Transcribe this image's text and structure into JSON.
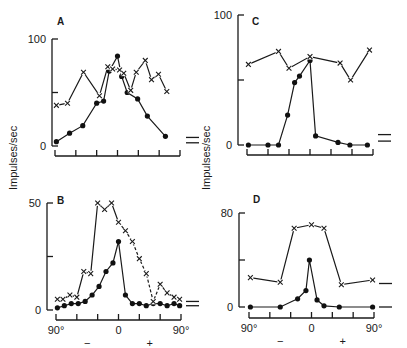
{
  "figure": {
    "ylabel": "Impulses/sec",
    "xtick_labels": [
      "90°",
      "0",
      "90°"
    ],
    "sign_labels": [
      "−",
      "+"
    ]
  },
  "chart_data": [
    {
      "panel": "A",
      "type": "line",
      "xlabel": "",
      "ylabel": "Impulses/sec",
      "xlim": [
        -90,
        90
      ],
      "ylim": [
        0,
        100
      ],
      "yticks": [
        0,
        50,
        100
      ],
      "ytick_labels": [
        "0",
        "",
        "100"
      ],
      "xticks": [
        -90,
        -60,
        -30,
        0,
        30,
        60,
        90
      ],
      "xtick_labels": [],
      "spontaneous_levels": [
        8,
        3
      ],
      "series": [
        {
          "name": "dots",
          "marker": "circle",
          "style": "solid",
          "x": [
            -88,
            -69,
            -50,
            -30,
            -20,
            -12,
            0,
            6,
            14,
            29,
            43,
            69
          ],
          "y": [
            4,
            12,
            19,
            40,
            42,
            70,
            84,
            65,
            50,
            44,
            28,
            9
          ]
        },
        {
          "name": "crosses",
          "marker": "x",
          "style": "solid",
          "x": [
            -88,
            -72,
            -49,
            -26,
            -14,
            -7,
            3,
            9,
            19,
            27,
            40,
            49,
            59,
            71
          ],
          "y": [
            38,
            40,
            69,
            47,
            74,
            72,
            71,
            68,
            52,
            69,
            80,
            62,
            67,
            51
          ]
        }
      ]
    },
    {
      "panel": "B",
      "type": "line",
      "xlabel": "",
      "ylabel": "Impulses/sec",
      "xlim": [
        -90,
        90
      ],
      "ylim": [
        0,
        50
      ],
      "yticks": [
        0,
        25,
        50
      ],
      "ytick_labels": [
        "0",
        "",
        "50"
      ],
      "xticks": [
        -90,
        -60,
        -30,
        0,
        30,
        60,
        90
      ],
      "xtick_labels": [
        "90°",
        "0",
        "90°"
      ],
      "spontaneous_levels": [
        4,
        2
      ],
      "series": [
        {
          "name": "dots",
          "marker": "circle",
          "style": "solid",
          "x": [
            -88,
            -78,
            -68,
            -58,
            -48,
            -38,
            -28,
            -18,
            -8,
            0,
            10,
            20,
            30,
            40,
            50,
            60,
            70,
            80,
            88
          ],
          "y": [
            1,
            2,
            3,
            3,
            4,
            7,
            11,
            18,
            22,
            32,
            7,
            3,
            3,
            2,
            3,
            3,
            2,
            3,
            2
          ]
        },
        {
          "name": "crosses",
          "marker": "x",
          "style": "solid-then-dashed",
          "x": [
            -88,
            -80,
            -70,
            -60,
            -50,
            -40,
            -30,
            -20,
            -10,
            0,
            10,
            20,
            30,
            40,
            50,
            60,
            70,
            80,
            88
          ],
          "y": [
            5,
            5,
            7,
            6,
            18,
            17,
            50,
            47,
            50,
            41,
            37,
            32,
            24,
            17,
            4,
            12,
            8,
            6,
            5
          ]
        }
      ]
    },
    {
      "panel": "C",
      "type": "line",
      "xlabel": "",
      "ylabel": "Impulses/sec",
      "xlim": [
        -90,
        90
      ],
      "ylim": [
        0,
        100
      ],
      "yticks": [
        0,
        50,
        100
      ],
      "ytick_labels": [
        "0",
        "",
        "100"
      ],
      "xticks": [
        -90,
        -60,
        -30,
        0,
        30,
        60,
        90
      ],
      "xtick_labels": [],
      "spontaneous_levels": [
        8,
        3
      ],
      "series": [
        {
          "name": "dots",
          "marker": "circle",
          "style": "solid",
          "x": [
            -88,
            -60,
            -45,
            -32,
            -22,
            -15,
            0,
            8,
            40,
            57,
            82
          ],
          "y": [
            0,
            0,
            0,
            23,
            48,
            53,
            65,
            7,
            2,
            0,
            0
          ]
        },
        {
          "name": "crosses",
          "marker": "x",
          "style": "solid",
          "x": [
            -88,
            -45,
            -30,
            0,
            43,
            58,
            85
          ],
          "y": [
            62,
            72,
            59,
            68,
            63,
            50,
            73
          ]
        }
      ]
    },
    {
      "panel": "D",
      "type": "line",
      "xlabel": "",
      "ylabel": "Impulses/sec",
      "xlim": [
        -90,
        90
      ],
      "ylim": [
        0,
        80
      ],
      "yticks": [
        0,
        40,
        80
      ],
      "ytick_labels": [
        "0",
        "",
        "80"
      ],
      "xticks": [
        -90,
        -60,
        -30,
        0,
        30,
        60,
        90
      ],
      "xtick_labels": [
        "90°",
        "0",
        "90°"
      ],
      "spontaneous_levels": [
        20,
        0
      ],
      "series": [
        {
          "name": "dots",
          "marker": "circle",
          "style": "solid",
          "x": [
            -88,
            -45,
            -20,
            -8,
            -3,
            8,
            18,
            40,
            88
          ],
          "y": [
            0,
            0,
            7,
            14,
            40,
            6,
            1,
            0,
            0
          ]
        },
        {
          "name": "crosses",
          "marker": "x",
          "style": "solid",
          "x": [
            -88,
            -45,
            -25,
            0,
            18,
            43,
            88
          ],
          "y": [
            25,
            21,
            67,
            70,
            67,
            19,
            23
          ]
        }
      ]
    }
  ]
}
